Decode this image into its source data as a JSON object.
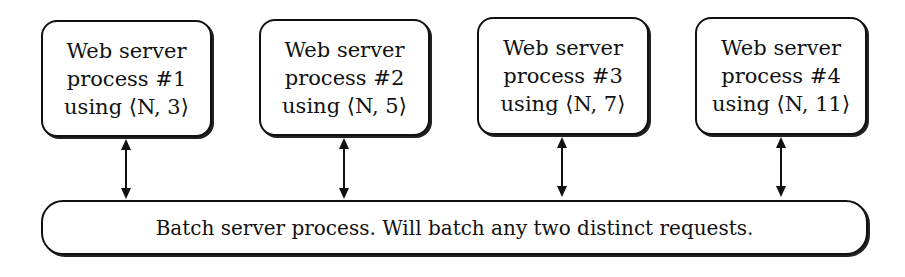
{
  "diagram": {
    "web_servers": [
      {
        "line1": "Web server",
        "line2": "process #1",
        "line3": "using ⟨N, 3⟩"
      },
      {
        "line1": "Web server",
        "line2": "process #2",
        "line3": "using ⟨N, 5⟩"
      },
      {
        "line1": "Web server",
        "line2": "process #3",
        "line3": "using ⟨N, 7⟩"
      },
      {
        "line1": "Web server",
        "line2": "process #4",
        "line3": "using ⟨N, 11⟩"
      }
    ],
    "batch_server": {
      "label": "Batch server process. Will batch any two distinct requests."
    },
    "edges": [
      {
        "from": "web_servers.0",
        "to": "batch_server",
        "type": "bidirectional"
      },
      {
        "from": "web_servers.1",
        "to": "batch_server",
        "type": "bidirectional"
      },
      {
        "from": "web_servers.2",
        "to": "batch_server",
        "type": "bidirectional"
      },
      {
        "from": "web_servers.3",
        "to": "batch_server",
        "type": "bidirectional"
      }
    ],
    "colors": {
      "stroke": "#111111",
      "fill": "#ffffff"
    }
  }
}
